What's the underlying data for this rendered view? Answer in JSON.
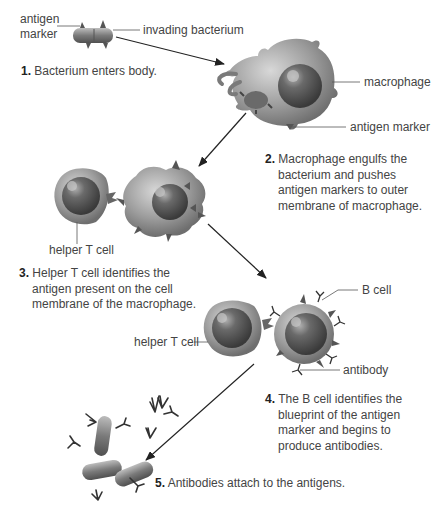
{
  "diagram": {
    "labels": {
      "antigen_marker_top": "antigen\nmarker",
      "antigen_marker_line1": "antigen",
      "antigen_marker_line2": "marker",
      "invading_bacterium": "invading bacterium",
      "macrophage": "macrophage",
      "antigen_marker": "antigen marker",
      "helper_t_cell_1": "helper T cell",
      "helper_t_cell_2": "helper T cell",
      "b_cell": "B cell",
      "antibody": "antibody"
    },
    "steps": [
      {
        "number": "1.",
        "text": "Bacterium enters body."
      },
      {
        "number": "2.",
        "text": "Macrophage engulfs the bacterium and pushes antigen markers to outer membrane of macrophage."
      },
      {
        "number": "3.",
        "text": "Helper T cell identifies the antigen present on the cell membrane of the macrophage."
      },
      {
        "number": "4.",
        "text": "The B cell identifies the blueprint of the antigen marker and begins to produce antibodies."
      },
      {
        "number": "5.",
        "text": "Antibodies attach to the antigens."
      }
    ],
    "colors": {
      "cell_body": "#9a9a9a",
      "nucleus": "#5a5a5a",
      "text": "#444444",
      "arrow": "#222222"
    }
  }
}
